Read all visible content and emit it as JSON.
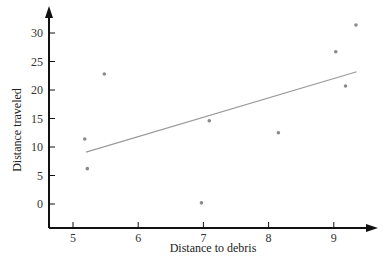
{
  "chart_data": {
    "type": "scatter",
    "title": "",
    "xlabel": "Distance to debris",
    "ylabel": "Distance traveled",
    "xlim": [
      4.65,
      9.6
    ],
    "ylim": [
      -4,
      34
    ],
    "x_ticks": [
      5,
      6,
      7,
      8,
      9
    ],
    "y_ticks": [
      0,
      5,
      10,
      15,
      20,
      25,
      30
    ],
    "grid": false,
    "legend": null,
    "series": [
      {
        "name": "observations",
        "kind": "points",
        "color": "#8a8a8a",
        "points": [
          {
            "x": 5.18,
            "y": 11.4
          },
          {
            "x": 5.22,
            "y": 6.2
          },
          {
            "x": 5.48,
            "y": 22.8
          },
          {
            "x": 6.97,
            "y": 0.2
          },
          {
            "x": 7.09,
            "y": 14.6
          },
          {
            "x": 8.15,
            "y": 12.5
          },
          {
            "x": 9.03,
            "y": 26.7
          },
          {
            "x": 9.18,
            "y": 20.7
          },
          {
            "x": 9.34,
            "y": 31.4
          }
        ]
      },
      {
        "name": "regression line",
        "kind": "line",
        "color": "#999999",
        "points": [
          {
            "x": 5.2,
            "y": 9.1
          },
          {
            "x": 9.35,
            "y": 23.2
          }
        ]
      }
    ]
  },
  "layout": {
    "axis_color": "#111111",
    "x_axis_origin_px": 49,
    "x_axis_end_px": 378,
    "y_axis_top_px": 6,
    "baseline_px": 228,
    "x_px_per_unit": 65.2,
    "x_px_at_5": 73,
    "y_px_per_unit": 5.7,
    "y_px_at_0": 204
  }
}
